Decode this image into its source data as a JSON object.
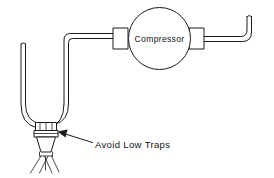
{
  "figure": {
    "type": "technical-line-diagram",
    "background_color": "#ffffff",
    "line_color": "#1a1a1a"
  },
  "labels": {
    "compressor": "Compressor",
    "warning": "Avoid Low Traps"
  },
  "components": {
    "compressor_body": {
      "shape": "circle",
      "label": "Compressor"
    },
    "left_flange": {
      "shape": "rectangle"
    },
    "right_flange": {
      "shape": "rectangle"
    },
    "inlet_pipe": {
      "shape": "double-line-pipe"
    },
    "outlet_pipe": {
      "shape": "double-line-pipe"
    },
    "u_trap": {
      "shape": "u-bend-pipe"
    },
    "dead_leg_pipe": {
      "shape": "capped-vertical-pipe"
    },
    "coupling_nut": {
      "shape": "banded-collar"
    },
    "spray_nozzle": {
      "shape": "tapered-cone"
    },
    "spray_pattern": {
      "shape": "splayed-lines"
    },
    "callout_arrow": {
      "shape": "arrow",
      "points_to": "coupling_nut"
    }
  }
}
